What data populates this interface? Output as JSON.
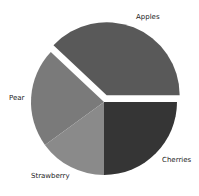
{
  "chart_data": {
    "type": "pie",
    "title": "",
    "categories": [
      "Apples",
      "Pear",
      "Strawberry",
      "Cherries"
    ],
    "values": [
      38,
      22,
      15,
      25
    ],
    "start_angle_deg": 0,
    "direction": "counterclockwise",
    "explode": [
      0.1,
      0,
      0,
      0
    ],
    "colors": [
      "#595959",
      "#7a7a7a",
      "#8a8a8a",
      "#353535"
    ],
    "legend": null,
    "grid": false
  },
  "labels": {
    "apples": "Apples",
    "pear": "Pear",
    "strawberry": "Strawberry",
    "cherries": "Cherries"
  }
}
